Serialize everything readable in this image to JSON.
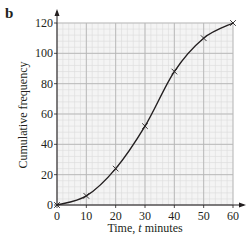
{
  "part_label": "b",
  "chart_data": {
    "type": "line",
    "title": "",
    "xlabel": "Time, t minutes",
    "xlabel_parts": [
      "Time, ",
      "t",
      " minutes"
    ],
    "ylabel": "Cumulative frequency",
    "x": [
      0,
      10,
      20,
      30,
      40,
      50,
      60
    ],
    "series": [
      {
        "name": "Cumulative frequency",
        "values": [
          0,
          6,
          24,
          52,
          88,
          110,
          120
        ],
        "marker": "x",
        "smooth": true
      }
    ],
    "xlim": [
      0,
      60
    ],
    "ylim": [
      0,
      120
    ],
    "xticks": [
      0,
      10,
      20,
      30,
      40,
      50,
      60
    ],
    "yticks": [
      0,
      20,
      40,
      60,
      80,
      100,
      120
    ],
    "grid": {
      "on": true,
      "major_x": 10,
      "major_y": 20,
      "minor_per_major": 5
    },
    "legend": null
  },
  "colors": {
    "ink": "#231f20",
    "grid_major": "#b5b5b5",
    "grid_minor": "#dcdcdc"
  }
}
